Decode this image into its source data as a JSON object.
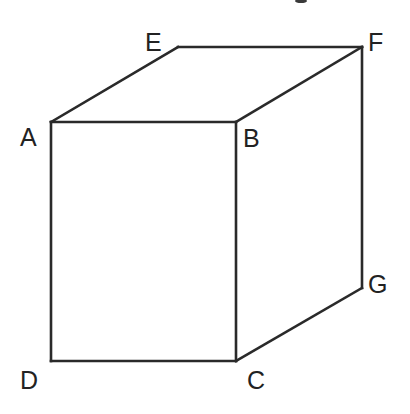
{
  "diagram": {
    "type": "cube-perspective",
    "stroke_color": "#2a2a2a",
    "label_color": "#222222",
    "vertices": {
      "A": {
        "label": "A",
        "x": 51,
        "y": 122
      },
      "B": {
        "label": "B",
        "x": 236,
        "y": 122
      },
      "C": {
        "label": "C",
        "x": 236,
        "y": 361
      },
      "D": {
        "label": "D",
        "x": 51,
        "y": 361
      },
      "E": {
        "label": "E",
        "x": 178,
        "y": 47
      },
      "F": {
        "label": "F",
        "x": 362,
        "y": 47
      },
      "G": {
        "label": "G",
        "x": 362,
        "y": 288
      }
    },
    "edges": [
      [
        "A",
        "B"
      ],
      [
        "B",
        "C"
      ],
      [
        "C",
        "D"
      ],
      [
        "D",
        "A"
      ],
      [
        "A",
        "E"
      ],
      [
        "E",
        "F"
      ],
      [
        "F",
        "B"
      ],
      [
        "F",
        "G"
      ],
      [
        "G",
        "C"
      ]
    ],
    "labels": {
      "A": "A",
      "B": "B",
      "C": "C",
      "D": "D",
      "E": "E",
      "F": "F",
      "G": "G"
    }
  }
}
